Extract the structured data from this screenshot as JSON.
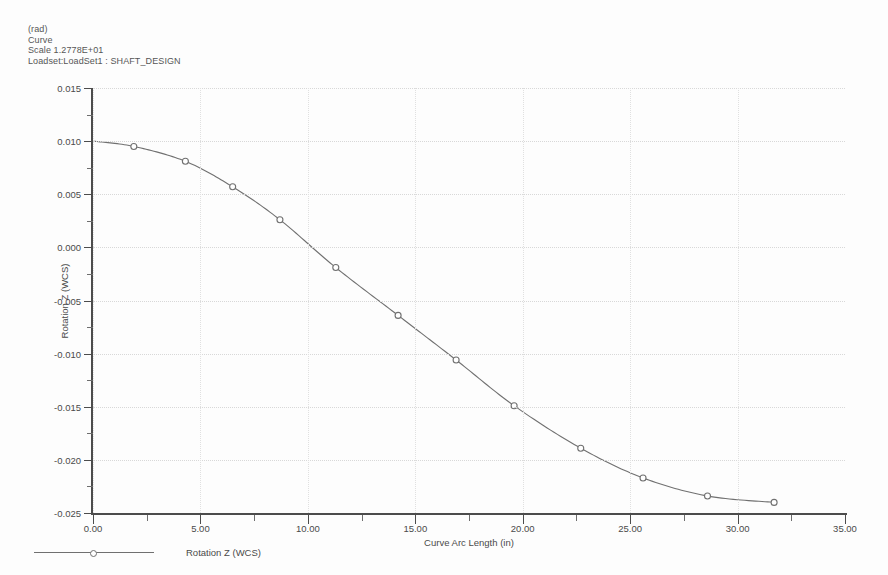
{
  "header": {
    "units": "(rad)",
    "plot_type": "Curve",
    "scale": "Scale  1.2778E+01",
    "loadset": "Loadset:LoadSet1 :  SHAFT_DESIGN"
  },
  "legend": {
    "entry_label": "Rotation Z (WCS)",
    "marker_icon": "circle-marker-icon"
  },
  "colors": {
    "curve": "#707070",
    "marker_stroke": "#707070",
    "marker_fill": "#ffffff",
    "axis": "#4c4c4c",
    "grid": "#d8d8d8",
    "text": "#4a4a4a",
    "background": "#fdfdfd"
  },
  "chart_data": {
    "type": "line",
    "title": "",
    "subtitle": "",
    "xlabel": "Curve Arc Length (in)",
    "ylabel": "Rotation Z (WCS)",
    "xlim": [
      0,
      35
    ],
    "ylim": [
      -0.025,
      0.015
    ],
    "xticks": [
      0,
      5,
      10,
      15,
      20,
      25,
      30,
      35
    ],
    "xticklabels": [
      "0.00",
      "5.00",
      "10.00",
      "15.00",
      "20.00",
      "25.00",
      "30.00",
      "35.00"
    ],
    "yticks": [
      0.015,
      0.01,
      0.005,
      0.0,
      -0.005,
      -0.01,
      -0.015,
      -0.02,
      -0.025
    ],
    "yticklabels": [
      "0.015",
      "0.010",
      "0.005",
      "0.000",
      "-0.005",
      "-0.010",
      "-0.015",
      "-0.020",
      "-0.025"
    ],
    "x_minor_interval": 2.5,
    "y_minor_interval": 0.0025,
    "grid": true,
    "grid_style": "dotted",
    "legend_position": "below-left",
    "series": [
      {
        "name": "Rotation Z (WCS)",
        "marker": "circle",
        "x": [
          0.0,
          1.9,
          4.3,
          6.5,
          8.7,
          11.3,
          14.2,
          16.9,
          19.6,
          22.7,
          25.6,
          28.6,
          31.7
        ],
        "y": [
          0.01,
          0.0095,
          0.0081,
          0.0057,
          0.0026,
          -0.0019,
          -0.0064,
          -0.0106,
          -0.0149,
          -0.0189,
          -0.0217,
          -0.0234,
          -0.024
        ]
      }
    ]
  }
}
